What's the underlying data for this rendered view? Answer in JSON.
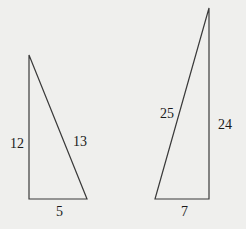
{
  "triangles": [
    {
      "name": "triangle-5-12-13",
      "vertices": [
        [
          29,
          55
        ],
        [
          29,
          199
        ],
        [
          87,
          199
        ]
      ],
      "labels": {
        "vertical_leg": "12",
        "hypotenuse": "13",
        "base": "5"
      }
    },
    {
      "name": "triangle-7-24-25",
      "vertices": [
        [
          155,
          199
        ],
        [
          209,
          199
        ],
        [
          209,
          8
        ]
      ],
      "labels": {
        "hypotenuse": "25",
        "vertical_leg": "24",
        "base": "7"
      }
    }
  ],
  "colors": {
    "background": "#efefed",
    "line": "#3a3a3a",
    "text": "#1a1a1a"
  }
}
